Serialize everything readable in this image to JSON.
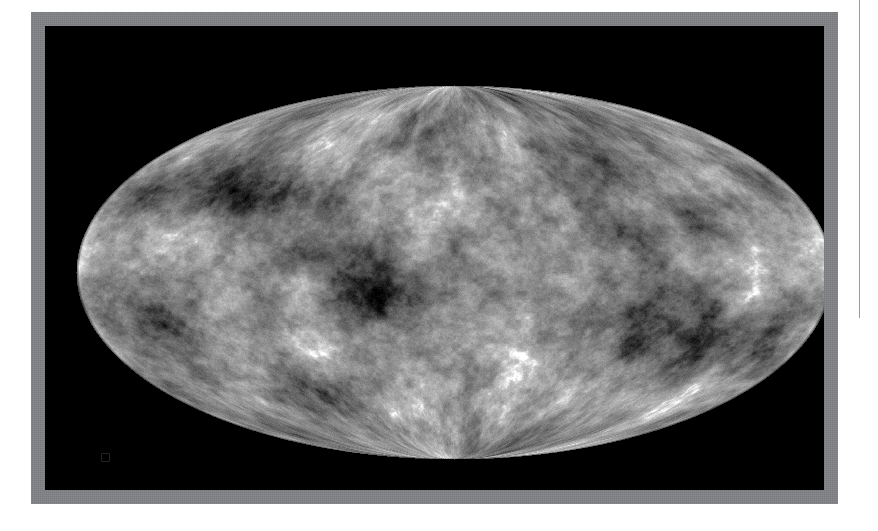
{
  "page": {
    "background_color": "#ffffff",
    "width": 878,
    "height": 531
  },
  "figure": {
    "name": "cmb-all-sky-map",
    "frame_color": "#808285",
    "frame_border_px": 14,
    "field_color": "#000000",
    "projection": "Mollweide",
    "colormap": "grayscale",
    "caption": "",
    "artifact_mark_label": ""
  },
  "right_rule": {
    "color": "#9a9a9a",
    "height_px": 318
  },
  "chart_data": {
    "type": "heatmap",
    "title": "",
    "subtitle": "",
    "xlabel": "",
    "ylabel": "",
    "projection": "Mollweide (equal-area all-sky)",
    "coordinate_system": "Galactic",
    "colormap": "grayscale",
    "legend": [],
    "annotations": [],
    "grid": false,
    "ellipse": {
      "center_x": 409,
      "center_y": 246,
      "semi_axis_x": 378,
      "semi_axis_y": 187
    },
    "value_range": [
      -1,
      1
    ],
    "field_description": "Cosmic microwave background temperature anisotropy speckle",
    "feature_blobs": [
      {
        "x": -0.22,
        "y": 0.05,
        "r": 0.18,
        "v": -0.95
      },
      {
        "x": 0.02,
        "y": 0.1,
        "r": 0.14,
        "v": -0.8
      },
      {
        "x": 0.5,
        "y": 0.22,
        "r": 0.15,
        "v": -0.85
      },
      {
        "x": 0.62,
        "y": -0.3,
        "r": 0.12,
        "v": -0.7
      },
      {
        "x": -0.58,
        "y": -0.42,
        "r": 0.13,
        "v": -0.75
      },
      {
        "x": -0.8,
        "y": 0.3,
        "r": 0.11,
        "v": -0.65
      },
      {
        "x": 0.3,
        "y": -0.55,
        "r": 0.12,
        "v": -0.6
      },
      {
        "x": -0.3,
        "y": 0.6,
        "r": 0.12,
        "v": -0.55
      },
      {
        "x": 0.82,
        "y": 0.35,
        "r": 0.1,
        "v": -0.6
      },
      {
        "x": -0.05,
        "y": -0.7,
        "r": 0.11,
        "v": -0.5
      },
      {
        "x": 0.18,
        "y": 0.52,
        "r": 0.1,
        "v": 0.55
      },
      {
        "x": -0.45,
        "y": -0.1,
        "r": 0.09,
        "v": 0.45
      },
      {
        "x": 0.7,
        "y": 0.0,
        "r": 0.09,
        "v": 0.4
      },
      {
        "x": -0.7,
        "y": 0.1,
        "r": 0.1,
        "v": 0.35
      }
    ]
  }
}
